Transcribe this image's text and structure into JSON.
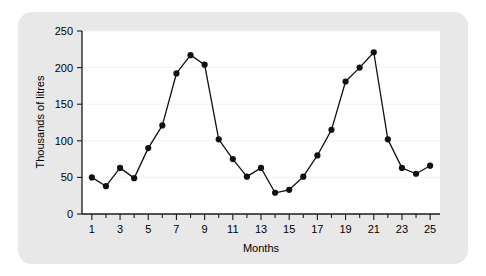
{
  "chart_data": {
    "type": "line",
    "title": "",
    "subtitle": "",
    "xlabel": "Months",
    "ylabel": "Thousands of litres",
    "x": [
      1,
      2,
      3,
      4,
      5,
      6,
      7,
      8,
      9,
      10,
      11,
      12,
      13,
      14,
      15,
      16,
      17,
      18,
      19,
      20,
      21,
      22,
      23,
      24,
      25
    ],
    "values": [
      50,
      38,
      63,
      49,
      90,
      121,
      192,
      217,
      204,
      102,
      75,
      51,
      63,
      29,
      33,
      51,
      80,
      115,
      181,
      200,
      221,
      102,
      63,
      55,
      66
    ],
    "series": [
      {
        "name": "Volume",
        "values": [
          50,
          38,
          63,
          49,
          90,
          121,
          192,
          217,
          204,
          102,
          75,
          51,
          63,
          29,
          33,
          51,
          80,
          115,
          181,
          200,
          221,
          102,
          63,
          55,
          66
        ],
        "color": "#111111",
        "marker": "filled-circle"
      }
    ],
    "xlim": [
      0.3,
      25.7
    ],
    "ylim": [
      0,
      250
    ],
    "xticks": [
      1,
      3,
      5,
      7,
      9,
      11,
      13,
      15,
      17,
      19,
      21,
      23,
      25
    ],
    "xtick_labels": [
      "1",
      "3",
      "5",
      "7",
      "9",
      "11",
      "13",
      "15",
      "17",
      "19",
      "21",
      "23",
      "25"
    ],
    "xminorticks": [
      2,
      4,
      6,
      8,
      10,
      12,
      14,
      16,
      18,
      20,
      22,
      24
    ],
    "yticks": [
      0,
      50,
      100,
      150,
      200,
      250
    ],
    "ytick_labels": [
      "0",
      "50",
      "100",
      "150",
      "200",
      "250"
    ],
    "grid": "horizontal-faint",
    "legend": "none",
    "annotations": []
  },
  "figure": {
    "panel_color": "#e8e8e8",
    "plot_background": "#ffffff",
    "line_color": "#111111",
    "axis_color": "#1a1a1a"
  }
}
